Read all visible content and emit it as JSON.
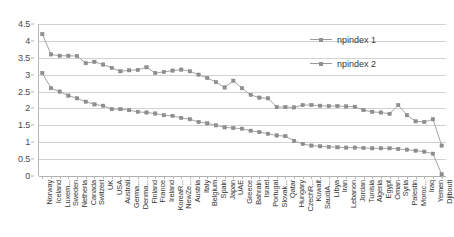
{
  "chart_data": {
    "type": "line",
    "title": "",
    "xlabel": "",
    "ylabel": "",
    "ylim": [
      0,
      4.5
    ],
    "ytick_step": 0.5,
    "grid": true,
    "legend_position": "top-right",
    "yticks": [
      "0",
      "0.5",
      "1",
      "1.5",
      "2",
      "2.5",
      "3",
      "3.5",
      "4",
      "4.5"
    ],
    "categories": [
      "Norway",
      "Iceland",
      "Luxem...",
      "Sweden",
      "Netherla",
      "Canada",
      "Switzerl",
      "UK",
      "USA",
      "Australi",
      "Germa...",
      "Denma...",
      "Finland",
      "France",
      "Ireland",
      "KoreaR...",
      "NewZe...",
      "Austria",
      "Italy",
      "Belgium",
      "Spain",
      "Japan",
      "UAE",
      "Greece",
      "Bahrain",
      "Israel",
      "Portugal",
      "Slovak...",
      "Qatar",
      "Hungary",
      "CzechR...",
      "Kuwait",
      "SaudiA...",
      "Libya",
      "Iran",
      "Lebanon",
      "Jordan",
      "Tunisia",
      "Algeria",
      "Egypt",
      "Oman",
      "Syria",
      "Palestin",
      "Moroc...",
      "Iraq",
      "Yemen",
      "Djibouti"
    ],
    "series": [
      {
        "name": "npindex 1",
        "color": "#8f8f8f",
        "values": [
          3.05,
          2.6,
          2.5,
          2.38,
          2.3,
          2.2,
          2.12,
          2.08,
          1.98,
          1.98,
          1.95,
          1.9,
          1.88,
          1.85,
          1.8,
          1.78,
          1.72,
          1.68,
          1.6,
          1.56,
          1.5,
          1.44,
          1.42,
          1.4,
          1.34,
          1.3,
          1.25,
          1.2,
          1.18,
          1.04,
          0.95,
          0.9,
          0.88,
          0.86,
          0.85,
          0.84,
          0.84,
          0.83,
          0.82,
          0.82,
          0.82,
          0.8,
          0.78,
          0.75,
          0.72,
          0.66,
          0.05
        ]
      },
      {
        "name": "npindex 2",
        "color": "#8f8f8f",
        "values": [
          4.2,
          3.6,
          3.56,
          3.56,
          3.55,
          3.34,
          3.38,
          3.3,
          3.2,
          3.1,
          3.13,
          3.14,
          3.22,
          3.05,
          3.08,
          3.12,
          3.15,
          3.1,
          3.0,
          2.9,
          2.78,
          2.62,
          2.82,
          2.6,
          2.4,
          2.32,
          2.3,
          2.04,
          2.04,
          2.03,
          2.1,
          2.1,
          2.08,
          2.07,
          2.07,
          2.06,
          2.05,
          1.95,
          1.9,
          1.88,
          1.84,
          2.1,
          1.8,
          1.62,
          1.6,
          1.68,
          0.9
        ]
      }
    ]
  },
  "legend": {
    "entries": [
      {
        "label": "npindex 1"
      },
      {
        "label": "npindex 2"
      }
    ]
  }
}
